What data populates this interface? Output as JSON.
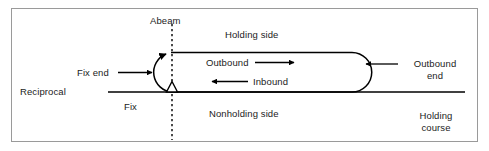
{
  "diagram": {
    "type": "aviation-holding-pattern",
    "colors": {
      "line": "#000000",
      "frame": "#9a9a9a",
      "background": "#ffffff",
      "text": "#1b1b1b"
    },
    "labels": {
      "abeam": "Abeam",
      "holding_side": "Holding side",
      "outbound": "Outbound",
      "inbound": "Inbound",
      "fix_end": "Fix end",
      "reciprocal": "Reciprocal",
      "fix": "Fix",
      "nonholding_side": "Nonholding side",
      "outbound_end_line1": "Outbound",
      "outbound_end_line2": "end",
      "holding_course_line1": "Holding",
      "holding_course_line2": "course"
    },
    "markers": {
      "fix_symbol": "triangle",
      "abeam_line_style": "dashed",
      "turn_direction": "right-hand"
    }
  }
}
